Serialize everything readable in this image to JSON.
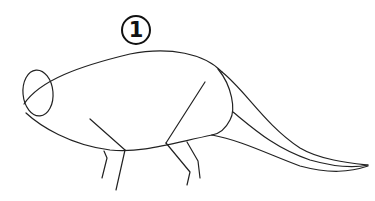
{
  "illustration": {
    "step_number": "1",
    "subject": "dinosaur body sketch",
    "stroke_color": "#222222",
    "background_color": "#ffffff"
  }
}
